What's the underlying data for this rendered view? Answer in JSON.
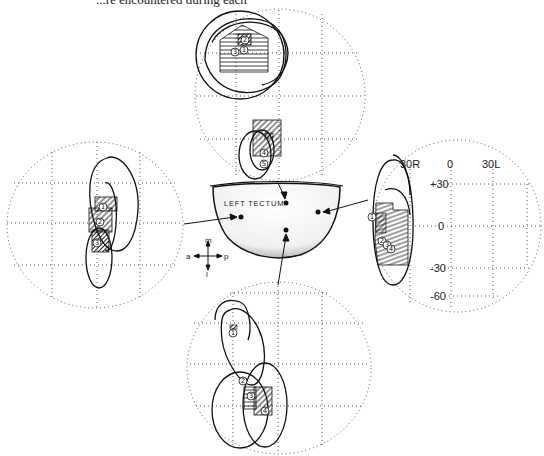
{
  "caption": "...re encountered during each",
  "tectum": {
    "label": "LEFT TECTUM",
    "compass": {
      "up": "m",
      "down": "l",
      "left": "a",
      "right": "p"
    }
  },
  "fields": [
    {
      "id": "top",
      "unit_labels": [
        "1",
        "2",
        "3",
        "4",
        "5"
      ]
    },
    {
      "id": "left",
      "unit_labels": [
        "1",
        "2",
        "3"
      ]
    },
    {
      "id": "right",
      "unit_labels": [
        "1",
        "2",
        "3",
        "4"
      ],
      "axes": {
        "x_ticks": [
          "30R",
          "0",
          "30L"
        ],
        "y_ticks": [
          "+30",
          "0",
          "-30",
          "-60"
        ]
      }
    },
    {
      "id": "bottom",
      "unit_labels": [
        "1",
        "2",
        "3",
        "4"
      ]
    }
  ],
  "colors": {
    "ink": "#111111",
    "grid": "#555555",
    "tectum_fill": "#f4f4f4"
  }
}
